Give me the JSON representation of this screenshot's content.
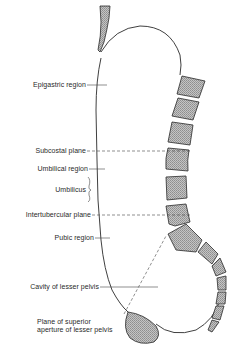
{
  "figure": {
    "type": "anatomical-diagram",
    "colors": {
      "line": "#2a2a2a",
      "bone_fill": "#b9b9b9",
      "background": "#ffffff"
    }
  },
  "labels": {
    "epigastric_region": "Epigastric region",
    "subcostal_plane": "Subcostal plane",
    "umbilical_region": "Umbilical region",
    "umbilicus": "Umbilicus",
    "intertubercular_plane": "Intertubercular plane",
    "pubic_region": "Pubic region",
    "cavity_lesser_pelvis": "Cavity of lesser pelvis",
    "plane_superior_aperture_line1": "Plane of superior",
    "plane_superior_aperture_line2": "aperture of lesser pelvis"
  }
}
